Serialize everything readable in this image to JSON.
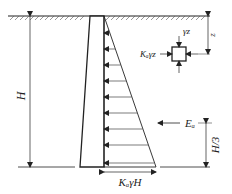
{
  "diagram": {
    "labels": {
      "height": "H",
      "depth": "z",
      "vertical_stress": "γz",
      "lateral_stress": "Kₐγz",
      "resultant_force": "Eₐ",
      "resultant_location": "H/3",
      "base_pressure": "KₐγH"
    },
    "colors": {
      "line": "#222222",
      "background": "#ffffff"
    },
    "pressure_arrow_count": 9
  }
}
